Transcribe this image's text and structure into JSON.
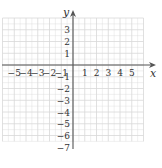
{
  "chart_data": {
    "type": "scatter",
    "title": "",
    "xlabel": "x",
    "ylabel": "y",
    "xlim": [
      -6,
      6
    ],
    "ylim": [
      -6.5,
      4
    ],
    "grid": true,
    "x_ticks": [
      -5,
      -4,
      -3,
      -2,
      -1,
      1,
      2,
      3,
      4,
      5
    ],
    "y_ticks": [
      3,
      2,
      1,
      -1,
      -2,
      -3,
      -4,
      -5,
      -6,
      -7
    ],
    "x_tick_labels": [
      "−5",
      "−4",
      "−3",
      "−2",
      "−1",
      "1",
      "2",
      "3",
      "4",
      "5"
    ],
    "y_tick_labels": [
      "3",
      "2",
      "1",
      "−1",
      "−2",
      "−3",
      "−4",
      "−5",
      "−6",
      "−7"
    ],
    "series": [],
    "legend": null
  },
  "colors": {
    "grid": "#d8d8d8",
    "axis": "#555555",
    "text": "#333333",
    "background": "#ffffff"
  }
}
